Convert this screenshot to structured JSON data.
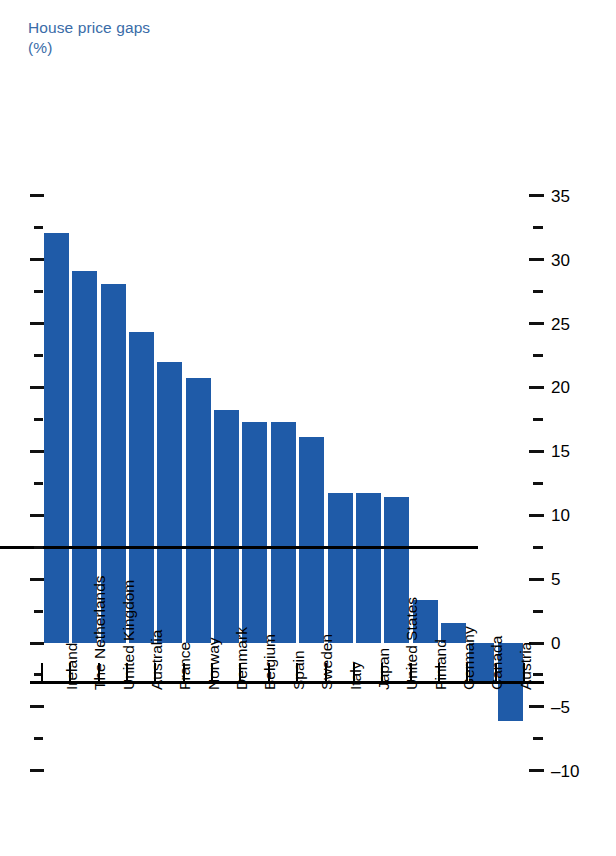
{
  "title": {
    "text": "House price gaps\n(%)",
    "color": "#3a6ca8"
  },
  "axis": {
    "unit_label": "(%)",
    "min": -10,
    "max": 35,
    "major_step": 5,
    "minor_step": 2.5,
    "labels": [
      "35",
      "30",
      "25",
      "20",
      "15",
      "10",
      "5",
      "0",
      "–5",
      "–10"
    ],
    "label_side": "right",
    "left_ticks_unlabeled": true
  },
  "colors": {
    "bar": "#1f5ba8",
    "axis": "#000000",
    "title": "#3a6ca8",
    "background": "#ffffff"
  },
  "chart_data": {
    "type": "bar",
    "title": "House price gaps (%)",
    "xlabel": "",
    "ylabel": "%",
    "ylim": [
      -10,
      35
    ],
    "grid": false,
    "legend": "none",
    "orientation": "vertical",
    "categories": [
      "Ireland",
      "The Netherlands",
      "United Kingdom",
      "Australia",
      "France",
      "Norway",
      "Denmark",
      "Belgium",
      "Spain",
      "Sweden",
      "Italy",
      "Japan",
      "United States",
      "Finland",
      "Germany",
      "Canada",
      "Austria"
    ],
    "values": [
      32.1,
      29.1,
      28.1,
      24.3,
      22.0,
      20.7,
      18.2,
      17.3,
      17.3,
      16.1,
      11.7,
      11.7,
      11.4,
      3.4,
      1.6,
      -3.0,
      -6.1
    ],
    "yticks_major": [
      35,
      30,
      25,
      20,
      15,
      10,
      5,
      0,
      -5,
      -10
    ],
    "yticks_minor": [
      32.5,
      27.5,
      22.5,
      17.5,
      12.5,
      7.5,
      2.5,
      -2.5,
      -7.5
    ]
  }
}
